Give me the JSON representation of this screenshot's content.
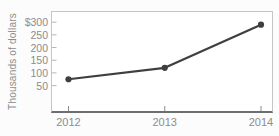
{
  "chart_data": {
    "type": "line",
    "title": "",
    "xlabel": "",
    "ylabel": "Thousands of dollars",
    "categories": [
      "2012",
      "2013",
      "2014"
    ],
    "values": [
      75,
      120,
      290
    ],
    "y_tick_labels": [
      "$300",
      "250",
      "200",
      "150",
      "100",
      "50"
    ],
    "y_tick_values": [
      300,
      250,
      200,
      150,
      100,
      50
    ],
    "ylim": [
      -50,
      340
    ],
    "grid": false,
    "legend_position": "none",
    "colors": {
      "line": "#3f3f3f",
      "marker": "#3f3f3f",
      "tick_label": "#8c8c8c",
      "axis_title": "#8c8c8c",
      "plot_border": "#c6c6c6",
      "axis_bottom": "#6e6e6e",
      "y_tick_mark": "#b5b5b5",
      "x_tick_mark": "#8a8a8a",
      "background": "#fcfcfc",
      "plot_background": "#ffffff"
    }
  }
}
